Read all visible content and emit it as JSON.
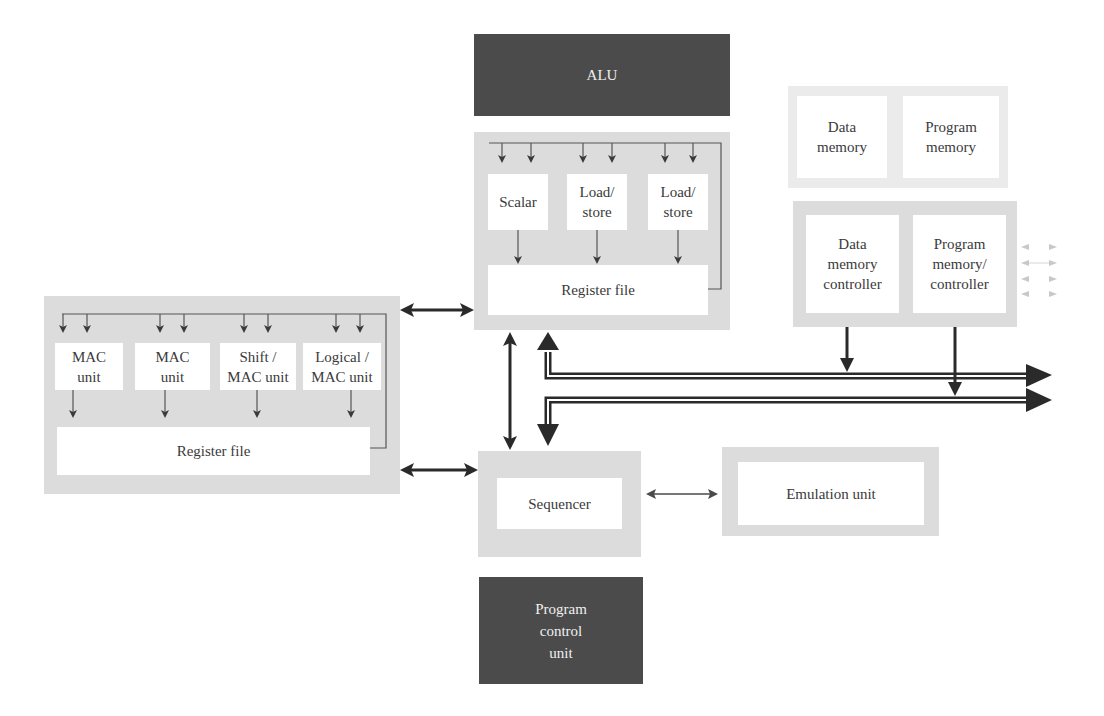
{
  "alu": {
    "label": "ALU"
  },
  "program_control_unit": {
    "label": "Program\ncontrol\nunit"
  },
  "top_cluster": {
    "units": [
      {
        "label": "Scalar"
      },
      {
        "label": "Load/\nstore"
      },
      {
        "label": "Load/\nstore"
      }
    ],
    "register_file": "Register file"
  },
  "left_cluster": {
    "units": [
      {
        "label": "MAC\nunit"
      },
      {
        "label": "MAC\nunit"
      },
      {
        "label": "Shift /\nMAC unit"
      },
      {
        "label": "Logical /\nMAC unit"
      }
    ],
    "register_file": "Register file"
  },
  "memory": {
    "data_memory": "Data\nmemory",
    "program_memory": "Program\nmemory"
  },
  "controllers": {
    "data_memory_controller": "Data\nmemory\ncontroller",
    "program_memory_controller": "Program\nmemory/\ncontroller"
  },
  "sequencer": {
    "label": "Sequencer"
  },
  "emulation_unit": {
    "label": "Emulation unit"
  },
  "colors": {
    "panel": "#dcdcdc",
    "dark_block": "#4b4b4b",
    "arrow": "#2a2a2a"
  }
}
